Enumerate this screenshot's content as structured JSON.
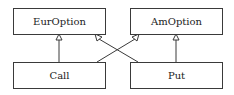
{
  "diagram": {
    "type": "uml-class-inheritance",
    "classes": [
      {
        "id": "euroption",
        "label": "EurOption"
      },
      {
        "id": "amoption",
        "label": "AmOption"
      },
      {
        "id": "call",
        "label": "Call"
      },
      {
        "id": "put",
        "label": "Put"
      }
    ],
    "relations": [
      {
        "from": "Call",
        "to": "EurOption",
        "kind": "generalization"
      },
      {
        "from": "Call",
        "to": "AmOption",
        "kind": "generalization"
      },
      {
        "from": "Put",
        "to": "EurOption",
        "kind": "generalization"
      },
      {
        "from": "Put",
        "to": "AmOption",
        "kind": "generalization"
      }
    ],
    "colors": {
      "line": "#3a3a3a",
      "background": "#ffffff"
    }
  }
}
